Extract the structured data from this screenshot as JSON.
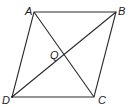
{
  "diagram": {
    "type": "parallelogram with diagonals",
    "vertices": {
      "A": {
        "label": "A",
        "x": 34,
        "y": 12,
        "lx": 25,
        "ly": 14
      },
      "B": {
        "label": "B",
        "x": 116,
        "y": 12,
        "lx": 118,
        "ly": 14
      },
      "C": {
        "label": "C",
        "x": 94,
        "y": 97,
        "lx": 98,
        "ly": 103
      },
      "D": {
        "label": "D",
        "x": 12,
        "y": 97,
        "lx": 2,
        "ly": 103
      }
    },
    "intersection": {
      "label": "Q",
      "x": 64,
      "y": 55,
      "lx": 51,
      "ly": 60
    },
    "segments": [
      "AB",
      "BC",
      "CD",
      "DA",
      "AC",
      "BD"
    ]
  }
}
